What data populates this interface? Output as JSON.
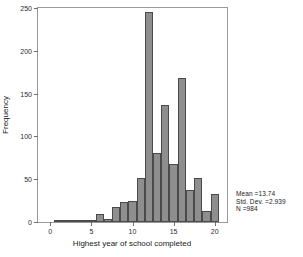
{
  "chart_data": {
    "type": "bar",
    "title": "",
    "subtitle": "",
    "xlabel": "Highest year of school completed",
    "ylabel": "Frequency",
    "xlim": [
      -1.5,
      21.5
    ],
    "ylim": [
      0,
      250
    ],
    "grid": false,
    "legend_position": "none",
    "x_ticks": [
      0,
      5,
      10,
      15,
      20
    ],
    "y_ticks": [
      0,
      50,
      100,
      150,
      200,
      250
    ],
    "bar_color": "#8e8e8e",
    "bar_edge_color": "#4a4a4a",
    "categories": [
      1,
      2,
      3,
      4,
      5,
      6,
      7,
      8,
      9,
      10,
      11,
      12,
      13,
      14,
      15,
      16,
      17,
      18,
      19,
      20
    ],
    "values": [
      1,
      2,
      1,
      1,
      2,
      9,
      3,
      17,
      23,
      25,
      52,
      245,
      81,
      137,
      68,
      168,
      37,
      51,
      13,
      33
    ],
    "annotations": [
      "Mean =13.74",
      "Std. Dev. =2.939",
      "N =984"
    ]
  },
  "stats": {
    "mean": "Mean =13.74",
    "std_dev": "Std. Dev. =2.939",
    "n": "N =984"
  },
  "axes": {
    "x_title": "Highest year of school completed",
    "y_title": "Frequency"
  }
}
